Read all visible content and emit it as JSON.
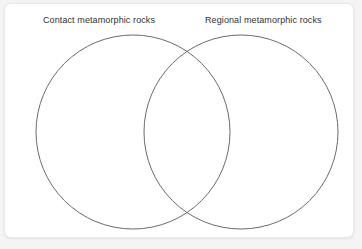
{
  "diagram": {
    "type": "venn",
    "set_count": 2,
    "title": "",
    "card": {
      "background_color": "#ffffff",
      "border_color": "#e9e9ec",
      "corner_radius_px": 7
    },
    "page_background_color": "#f4f4f5",
    "stroke_color": "#6b6b70",
    "label_color": "#2f2f33",
    "sets": [
      {
        "id": "contact",
        "label": "Contact metamorphic rocks",
        "center_x": 128,
        "center_y": 128,
        "radius": 97,
        "items": []
      },
      {
        "id": "regional",
        "label": "Regional metamorphic rocks",
        "center_x": 236,
        "center_y": 128,
        "radius": 97,
        "items": []
      }
    ],
    "intersection": {
      "label": "",
      "items": [],
      "top_point_x": 182,
      "top_point_y": 57,
      "bottom_point_x": 182,
      "bottom_point_y": 200
    }
  }
}
